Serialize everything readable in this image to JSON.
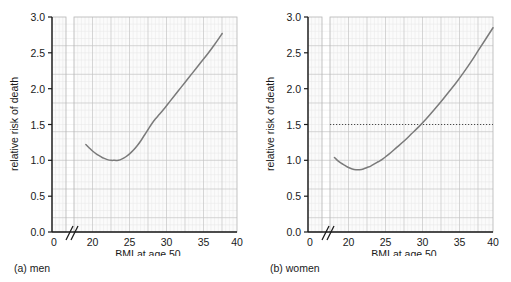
{
  "figure": {
    "panels": [
      {
        "id": "men",
        "caption": "(a) men",
        "chart_index": 0
      },
      {
        "id": "women",
        "caption": "(b) women",
        "chart_index": 1
      }
    ]
  },
  "chart_data": [
    {
      "type": "line",
      "title": "",
      "panel_label": "(a) men",
      "xlabel": "BMI at age 50",
      "ylabel": "relative risk of death",
      "xlim": [
        18,
        40
      ],
      "ylim": [
        0.0,
        3.0
      ],
      "axis_break": true,
      "axis_break_note": "x axis broken between 0 and 18",
      "xticks": [
        0,
        20,
        25,
        30,
        35,
        40
      ],
      "xticklabels": [
        "0",
        "20",
        "25",
        "30",
        "35",
        "40"
      ],
      "yticks": [
        0.0,
        0.5,
        1.0,
        1.5,
        2.0,
        2.5,
        3.0
      ],
      "yticklabels": [
        "0.0",
        "0.5",
        "1.0",
        "1.5",
        "2.0",
        "2.5",
        "3.0"
      ],
      "grid": true,
      "grid_minor": true,
      "legend": "none",
      "reference_line": null,
      "series": [
        {
          "name": "relative risk of death (men)",
          "color": "#7a7a7a",
          "x": [
            19.6,
            20.0,
            20.5,
            21.0,
            21.5,
            22.0,
            22.5,
            23.0,
            23.5,
            24.0,
            24.5,
            25.0,
            25.5,
            26.0,
            26.5,
            27.0,
            27.5,
            28.0,
            28.5,
            29.0,
            29.5,
            30.0,
            31.0,
            32.0,
            33.0,
            34.0,
            35.0,
            36.0,
            37.0,
            38.0
          ],
          "y": [
            1.22,
            1.18,
            1.13,
            1.09,
            1.06,
            1.03,
            1.01,
            1.0,
            1.0,
            1.0,
            1.02,
            1.05,
            1.09,
            1.14,
            1.2,
            1.27,
            1.35,
            1.43,
            1.51,
            1.58,
            1.64,
            1.7,
            1.83,
            1.96,
            2.09,
            2.22,
            2.35,
            2.48,
            2.62,
            2.77
          ]
        }
      ]
    },
    {
      "type": "line",
      "title": "",
      "panel_label": "(b) women",
      "xlabel": "BMI at age 50",
      "ylabel": "relative risk of death",
      "xlim": [
        18,
        40
      ],
      "ylim": [
        0.0,
        3.0
      ],
      "axis_break": true,
      "axis_break_note": "x axis broken between 0 and 18",
      "xticks": [
        0,
        20,
        25,
        30,
        35,
        40
      ],
      "xticklabels": [
        "0",
        "20",
        "25",
        "30",
        "35",
        "40"
      ],
      "yticks": [
        0.0,
        0.5,
        1.0,
        1.5,
        2.0,
        2.5,
        3.0
      ],
      "yticklabels": [
        "0.0",
        "0.5",
        "1.0",
        "1.5",
        "2.0",
        "2.5",
        "3.0"
      ],
      "grid": true,
      "grid_minor": true,
      "legend": "none",
      "reference_line": {
        "orientation": "horizontal",
        "y": 1.0,
        "style": "dotted",
        "color": "#4a4a4a"
      },
      "series": [
        {
          "name": "relative risk of death (women)",
          "color": "#7a7a7a",
          "x": [
            18.6,
            19.0,
            19.5,
            20.0,
            20.5,
            21.0,
            21.5,
            22.0,
            22.5,
            23.0,
            23.5,
            24.0,
            24.5,
            25.0,
            25.5,
            26.0,
            27.0,
            28.0,
            29.0,
            30.0,
            31.0,
            32.0,
            33.0,
            34.0,
            35.0,
            36.0,
            37.0,
            38.0,
            39.0,
            40.0
          ],
          "y": [
            1.04,
            1.0,
            0.96,
            0.93,
            0.9,
            0.88,
            0.87,
            0.87,
            0.88,
            0.9,
            0.92,
            0.95,
            0.98,
            1.01,
            1.05,
            1.09,
            1.18,
            1.27,
            1.37,
            1.47,
            1.58,
            1.7,
            1.82,
            1.95,
            2.08,
            2.22,
            2.37,
            2.53,
            2.69,
            2.85
          ]
        }
      ]
    }
  ]
}
